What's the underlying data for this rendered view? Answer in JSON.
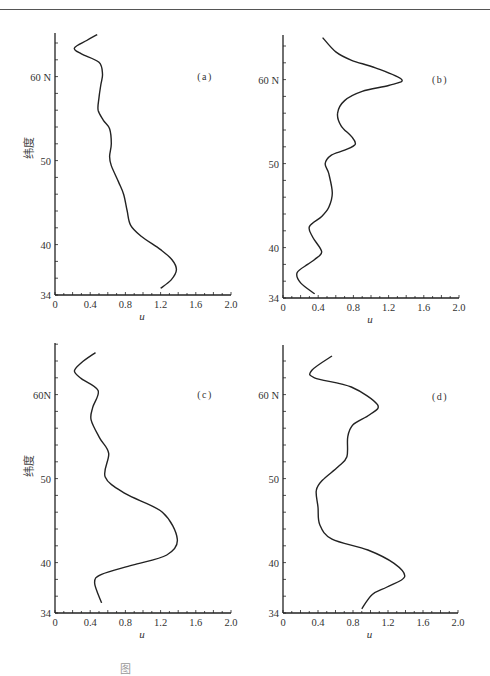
{
  "page": {
    "header_text": "",
    "caption": "图"
  },
  "chart_data": [
    {
      "type": "line",
      "panel_label": "(a)",
      "ylabel": "纬度",
      "xlabel": "u",
      "xlim": [
        0,
        2.0
      ],
      "ylim": [
        34,
        65
      ],
      "xticks": [
        "0",
        "0.4",
        "0.8",
        "1.2",
        "1.6",
        "2.0"
      ],
      "yticks": [
        {
          "value": 34,
          "label": "34"
        },
        {
          "value": 40,
          "label": "40"
        },
        {
          "value": 50,
          "label": "50"
        },
        {
          "value": 60,
          "label": "60 N"
        }
      ],
      "show_ylabel": true,
      "series": [
        {
          "name": "u(a)",
          "points": [
            [
              0.48,
              65.0
            ],
            [
              0.36,
              64.3
            ],
            [
              0.22,
              63.4
            ],
            [
              0.3,
              62.7
            ],
            [
              0.5,
              61.7
            ],
            [
              0.54,
              60.3
            ],
            [
              0.52,
              59.0
            ],
            [
              0.5,
              57.5
            ],
            [
              0.49,
              56.0
            ],
            [
              0.55,
              54.8
            ],
            [
              0.62,
              53.8
            ],
            [
              0.64,
              52.0
            ],
            [
              0.62,
              50.5
            ],
            [
              0.64,
              49.4
            ],
            [
              0.72,
              47.5
            ],
            [
              0.78,
              46.0
            ],
            [
              0.82,
              44.0
            ],
            [
              0.86,
              42.3
            ],
            [
              0.98,
              41.0
            ],
            [
              1.2,
              39.4
            ],
            [
              1.33,
              38.2
            ],
            [
              1.38,
              37.0
            ],
            [
              1.32,
              35.8
            ],
            [
              1.2,
              34.8
            ]
          ]
        }
      ]
    },
    {
      "type": "line",
      "panel_label": "(b)",
      "ylabel": "",
      "xlabel": "u",
      "xlim": [
        0,
        2.0
      ],
      "ylim": [
        34,
        65
      ],
      "xticks": [
        "0",
        "0.4",
        "0.8",
        "1.2",
        "1.6",
        "2.0"
      ],
      "yticks": [
        {
          "value": 34,
          "label": "34"
        },
        {
          "value": 40,
          "label": "40"
        },
        {
          "value": 50,
          "label": "50"
        },
        {
          "value": 60,
          "label": "60 N"
        }
      ],
      "show_ylabel": false,
      "series": [
        {
          "name": "u(b)",
          "points": [
            [
              0.45,
              65.0
            ],
            [
              0.6,
              63.3
            ],
            [
              0.78,
              62.3
            ],
            [
              1.05,
              61.4
            ],
            [
              1.35,
              60.0
            ],
            [
              1.2,
              59.3
            ],
            [
              0.9,
              58.6
            ],
            [
              0.7,
              57.5
            ],
            [
              0.62,
              56.0
            ],
            [
              0.66,
              54.5
            ],
            [
              0.78,
              53.2
            ],
            [
              0.82,
              52.3
            ],
            [
              0.7,
              51.6
            ],
            [
              0.55,
              51.0
            ],
            [
              0.48,
              50.0
            ],
            [
              0.52,
              48.8
            ],
            [
              0.56,
              46.5
            ],
            [
              0.52,
              44.8
            ],
            [
              0.44,
              43.7
            ],
            [
              0.3,
              42.5
            ],
            [
              0.34,
              41.2
            ],
            [
              0.44,
              39.5
            ],
            [
              0.36,
              38.6
            ],
            [
              0.28,
              38.0
            ],
            [
              0.16,
              37.0
            ],
            [
              0.2,
              35.8
            ],
            [
              0.36,
              34.5
            ]
          ]
        }
      ]
    },
    {
      "type": "line",
      "panel_label": "(c)",
      "ylabel": "纬度",
      "xlabel": "u",
      "xlim": [
        0,
        2.0
      ],
      "ylim": [
        34,
        65
      ],
      "xticks": [
        "0",
        "0.4",
        "0.8",
        "1.2",
        "1.6",
        "2.0"
      ],
      "yticks": [
        {
          "value": 34,
          "label": "34"
        },
        {
          "value": 40,
          "label": "40"
        },
        {
          "value": 50,
          "label": "50"
        },
        {
          "value": 60,
          "label": "60N"
        }
      ],
      "show_ylabel": true,
      "series": [
        {
          "name": "u(c)",
          "points": [
            [
              0.46,
              65.0
            ],
            [
              0.3,
              63.8
            ],
            [
              0.22,
              62.8
            ],
            [
              0.3,
              61.9
            ],
            [
              0.49,
              60.5
            ],
            [
              0.43,
              58.5
            ],
            [
              0.41,
              57.0
            ],
            [
              0.51,
              54.8
            ],
            [
              0.61,
              53.0
            ],
            [
              0.57,
              50.2
            ],
            [
              0.8,
              48.2
            ],
            [
              1.22,
              46.0
            ],
            [
              1.39,
              42.8
            ],
            [
              1.27,
              40.9
            ],
            [
              0.88,
              39.7
            ],
            [
              0.53,
              38.6
            ],
            [
              0.45,
              37.6
            ],
            [
              0.53,
              35.2
            ]
          ]
        }
      ]
    },
    {
      "type": "line",
      "panel_label": "(d)",
      "ylabel": "",
      "xlabel": "u",
      "xlim": [
        0,
        2.0
      ],
      "ylim": [
        34,
        65
      ],
      "xticks": [
        "0",
        "0.4",
        "0.8",
        "1.2",
        "1.6",
        "2.0"
      ],
      "yticks": [
        {
          "value": 34,
          "label": "34"
        },
        {
          "value": 40,
          "label": "40"
        },
        {
          "value": 50,
          "label": "50"
        },
        {
          "value": 60,
          "label": "60 N"
        }
      ],
      "show_ylabel": false,
      "series": [
        {
          "name": "u(d)",
          "points": [
            [
              0.56,
              64.6
            ],
            [
              0.33,
              62.9
            ],
            [
              0.36,
              62.0
            ],
            [
              0.78,
              60.9
            ],
            [
              1.08,
              58.8
            ],
            [
              0.99,
              57.6
            ],
            [
              0.8,
              56.4
            ],
            [
              0.74,
              55.0
            ],
            [
              0.73,
              52.6
            ],
            [
              0.63,
              51.4
            ],
            [
              0.45,
              49.8
            ],
            [
              0.38,
              48.6
            ],
            [
              0.4,
              46.6
            ],
            [
              0.42,
              44.5
            ],
            [
              0.56,
              42.8
            ],
            [
              0.97,
              41.5
            ],
            [
              1.27,
              39.9
            ],
            [
              1.39,
              38.3
            ],
            [
              1.19,
              37.1
            ],
            [
              1.02,
              36.2
            ],
            [
              0.9,
              34.5
            ]
          ]
        }
      ]
    }
  ]
}
